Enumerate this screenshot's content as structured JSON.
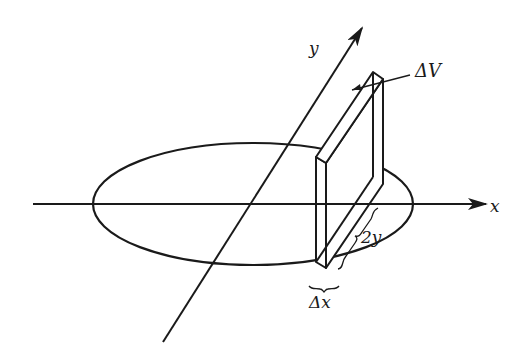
{
  "figure": {
    "labels": {
      "x_axis": "x",
      "y_axis": "y",
      "volume_element": "ΔV",
      "slab_height": "2y",
      "slab_width": "Δx"
    },
    "colors": {
      "stroke": "#1a1a1a",
      "background": "#ffffff"
    }
  }
}
